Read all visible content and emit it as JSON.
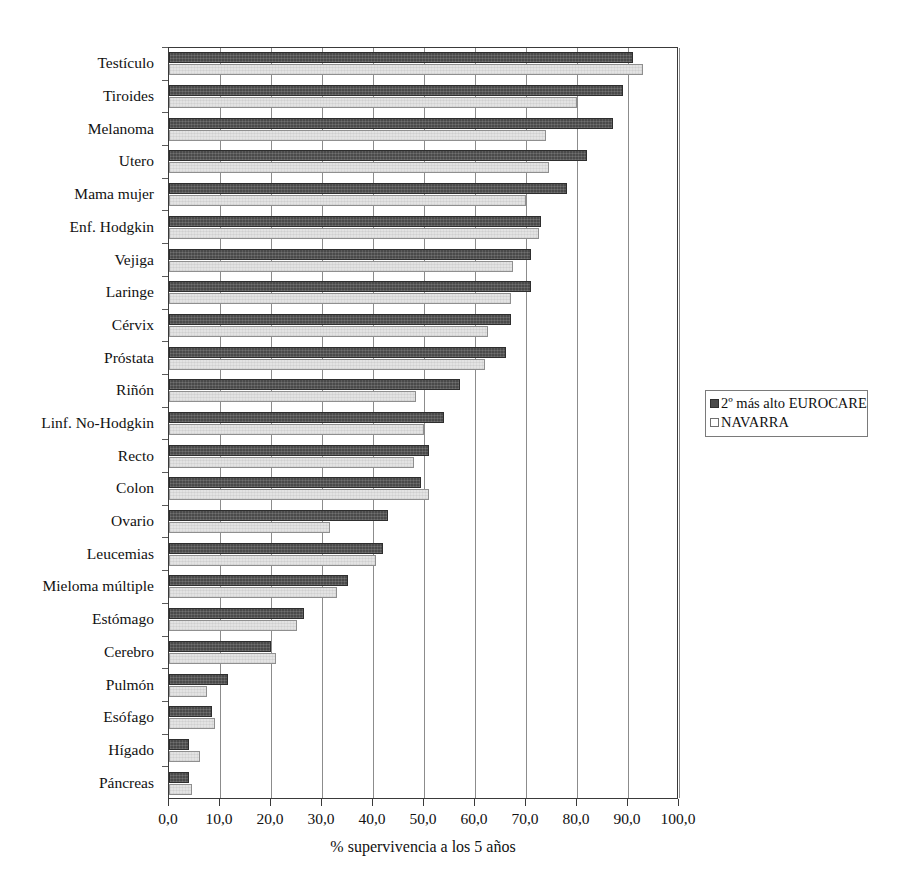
{
  "chart_data": {
    "type": "bar",
    "orientation": "horizontal",
    "title": "",
    "subtitle": "",
    "xlabel": "% supervivencia a los 5 años",
    "ylabel": "",
    "xlim": [
      0,
      100
    ],
    "grid": true,
    "legend_position": "right",
    "x_tick_labels": [
      "0,0",
      "10,0",
      "20,0",
      "30,0",
      "40,0",
      "50,0",
      "60,0",
      "70,0",
      "80,0",
      "90,0",
      "100,0"
    ],
    "x_ticks": [
      0,
      10,
      20,
      30,
      40,
      50,
      60,
      70,
      80,
      90,
      100
    ],
    "categories": [
      "Testículo",
      "Tiroides",
      "Melanoma",
      "Utero",
      "Mama mujer",
      "Enf. Hodgkin",
      "Vejiga",
      "Laringe",
      "Cérvix",
      "Próstata",
      "Riñón",
      "Linf. No-Hodgkin",
      "Recto",
      "Colon",
      "Ovario",
      "Leucemias",
      "Mieloma múltiple",
      "Estómago",
      "Cerebro",
      "Pulmón",
      "Esófago",
      "Hígado",
      "Páncreas"
    ],
    "series": [
      {
        "name": "2º más alto EUROCARE",
        "color": "#4a4a4a",
        "values": [
          91.0,
          89.0,
          87.0,
          82.0,
          78.0,
          73.0,
          71.0,
          71.0,
          67.0,
          66.0,
          57.0,
          54.0,
          51.0,
          49.5,
          43.0,
          42.0,
          35.0,
          26.5,
          20.0,
          11.5,
          8.5,
          4.0,
          4.0
        ]
      },
      {
        "name": "NAVARRA",
        "color": "#e3e3e3",
        "values": [
          93.0,
          80.0,
          74.0,
          74.5,
          70.0,
          72.5,
          67.5,
          67.0,
          62.5,
          62.0,
          48.5,
          50.0,
          48.0,
          51.0,
          31.5,
          40.5,
          33.0,
          25.0,
          21.0,
          7.5,
          9.0,
          6.0,
          4.5
        ]
      }
    ]
  },
  "legend": {
    "items": [
      {
        "label": "2º más alto EUROCARE",
        "swatch": "dark"
      },
      {
        "label": "NAVARRA",
        "swatch": "light"
      }
    ]
  }
}
